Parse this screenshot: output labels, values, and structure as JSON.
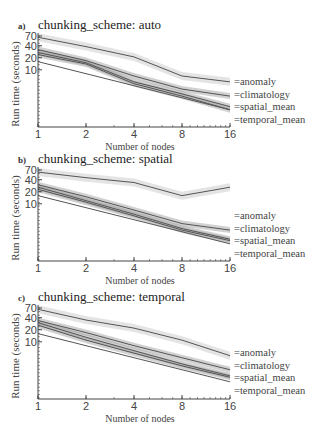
{
  "chart_data": [
    {
      "type": "line",
      "panel_label": "a)",
      "title": "chunking_scheme: auto",
      "xlabel": "Number of nodes",
      "ylabel": "Run time (seconds)",
      "x": [
        1,
        2,
        4,
        8,
        16
      ],
      "xscale": "log2",
      "yscale": "log",
      "yticks": [
        10,
        20,
        40,
        70
      ],
      "xticks": [
        1,
        2,
        4,
        8,
        16
      ],
      "series": [
        {
          "name": "anomaly",
          "values": [
            65,
            38,
            21,
            7,
            5
          ]
        },
        {
          "name": "climatology",
          "values": [
            32,
            17,
            7,
            3.3,
            2.2
          ]
        },
        {
          "name": "spatial_mean",
          "values": [
            27,
            15,
            5,
            2.5,
            1.2
          ]
        },
        {
          "name": "temporal_mean",
          "values": [
            24,
            14,
            4.5,
            2.2,
            1.0
          ]
        },
        {
          "name": "ideal_scaling",
          "values": [
            16,
            8,
            4,
            2,
            1
          ]
        }
      ],
      "legend_position": "right"
    },
    {
      "type": "line",
      "panel_label": "b)",
      "title": "chunking_scheme: spatial",
      "xlabel": "Number of nodes",
      "ylabel": "Run time (seconds)",
      "x": [
        1,
        2,
        4,
        8,
        16
      ],
      "xscale": "log2",
      "yscale": "log",
      "yticks": [
        10,
        20,
        40,
        70
      ],
      "xticks": [
        1,
        2,
        4,
        8,
        16
      ],
      "series": [
        {
          "name": "anomaly",
          "values": [
            62,
            45,
            34,
            16,
            26
          ]
        },
        {
          "name": "climatology",
          "values": [
            30,
            15,
            7,
            3.2,
            2.2
          ]
        },
        {
          "name": "spatial_mean",
          "values": [
            26,
            12,
            5.5,
            2.4,
            1.3
          ]
        },
        {
          "name": "temporal_mean",
          "values": [
            23,
            11,
            5,
            2.2,
            1.2
          ]
        },
        {
          "name": "ideal_scaling",
          "values": [
            16,
            8,
            4,
            2,
            1
          ]
        }
      ],
      "legend_position": "right"
    },
    {
      "type": "line",
      "panel_label": "c)",
      "title": "chunking_scheme: temporal",
      "xlabel": "Number of nodes",
      "ylabel": "Run time (seconds)",
      "x": [
        1,
        2,
        4,
        8,
        16
      ],
      "xscale": "log2",
      "yscale": "log",
      "yticks": [
        10,
        20,
        40,
        70
      ],
      "xticks": [
        1,
        2,
        4,
        8,
        16
      ],
      "series": [
        {
          "name": "anomaly",
          "values": [
            65,
            35,
            22,
            11,
            4.5
          ]
        },
        {
          "name": "climatology",
          "values": [
            34,
            17,
            8,
            4,
            2
          ]
        },
        {
          "name": "spatial_mean",
          "values": [
            30,
            13,
            6,
            2.8,
            1.4
          ]
        },
        {
          "name": "temporal_mean",
          "values": [
            26,
            11,
            5.2,
            2.5,
            1.3
          ]
        },
        {
          "name": "ideal_scaling",
          "values": [
            16,
            8,
            4,
            2,
            1
          ]
        }
      ],
      "legend_position": "right"
    }
  ],
  "panels": [
    {
      "label": "a)",
      "title": "chunking_scheme: auto",
      "xlabel": "Number of nodes",
      "ylabel": "Run time (seconds)"
    },
    {
      "label": "b)",
      "title": "chunking_scheme: spatial",
      "xlabel": "Number of nodes",
      "ylabel": "Run time (seconds)"
    },
    {
      "label": "c)",
      "title": "chunking_scheme: temporal",
      "xlabel": "Number of nodes",
      "ylabel": "Run time (seconds)"
    }
  ],
  "legend": [
    "=anomaly",
    "=climatology",
    "=spatial_mean",
    "=temporal_mean"
  ],
  "axis": {
    "xticks": [
      "1",
      "2",
      "4",
      "8",
      "16"
    ],
    "yticks": [
      "70",
      "40",
      "20",
      "10"
    ]
  },
  "colors": {
    "line": "#555555",
    "band_light": "#d8d8d8",
    "band_dark": "#9a9a9a",
    "axis": "#444444"
  }
}
